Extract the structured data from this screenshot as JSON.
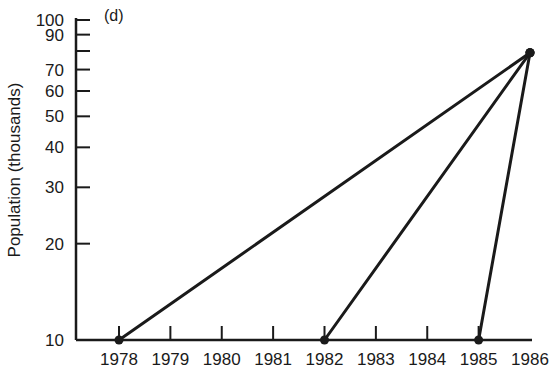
{
  "chart_data": {
    "type": "line",
    "title": "",
    "panel_label": "(d)",
    "xlabel": "",
    "ylabel": "Population (thousands)",
    "yscale": "log",
    "ylim": [
      10,
      100
    ],
    "xlim": [
      1978,
      1986
    ],
    "grid": false,
    "legend": null,
    "x_ticks": [
      "1978",
      "1979",
      "1980",
      "1981",
      "1982",
      "1983",
      "1984",
      "1985",
      "1986"
    ],
    "y_ticks": [
      {
        "value": 10,
        "label": "10"
      },
      {
        "value": 20,
        "label": "20"
      },
      {
        "value": 30,
        "label": "30"
      },
      {
        "value": 40,
        "label": "40"
      },
      {
        "value": 50,
        "label": "50"
      },
      {
        "value": 60,
        "label": "60"
      },
      {
        "value": 70,
        "label": "70"
      },
      {
        "value": 80,
        "label": ""
      },
      {
        "value": 90,
        "label": "90"
      },
      {
        "value": 100,
        "label": "100"
      }
    ],
    "series": [
      {
        "name": "line-from-1978",
        "points": [
          {
            "x": 1978,
            "y": 10
          },
          {
            "x": 1986,
            "y": 79
          }
        ]
      },
      {
        "name": "line-from-1982",
        "points": [
          {
            "x": 1982,
            "y": 10
          },
          {
            "x": 1986,
            "y": 79
          }
        ]
      },
      {
        "name": "line-from-1985",
        "points": [
          {
            "x": 1985,
            "y": 10
          },
          {
            "x": 1986,
            "y": 79
          }
        ]
      }
    ],
    "colors": {
      "ink": "#1a1a1a",
      "background": "#ffffff"
    }
  }
}
